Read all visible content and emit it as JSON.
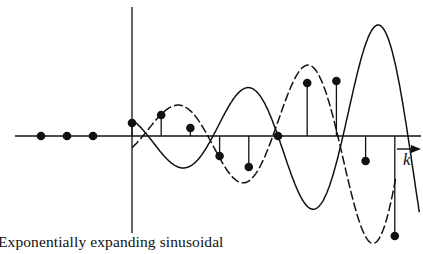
{
  "figure": {
    "caption": "Exponentially expanding sinusoidal",
    "axis_label": "k",
    "colors": {
      "ink": "#111111",
      "background": "#ffffff"
    }
  },
  "chart_data": {
    "type": "stem",
    "title": "Exponentially expanding sinusoidal",
    "xlabel": "k",
    "ylabel": "",
    "grid": false,
    "legend": [],
    "negative_k_samples": {
      "k": [
        -3,
        -2,
        -1
      ],
      "values": [
        0,
        0,
        0
      ]
    },
    "samples": {
      "k": [
        0,
        1,
        2,
        3,
        4,
        5,
        6,
        7,
        8,
        9
      ],
      "values": [
        0.13,
        0.21,
        0.08,
        -0.2,
        -0.31,
        0.0,
        0.53,
        0.55,
        -0.25,
        -1.0
      ]
    },
    "envelope_curves": [
      {
        "name": "solid sinusoid",
        "style": "solid"
      },
      {
        "name": "dashed sinusoid",
        "style": "dashed"
      }
    ],
    "annotations": [
      "arrow pointing right along k axis"
    ]
  }
}
